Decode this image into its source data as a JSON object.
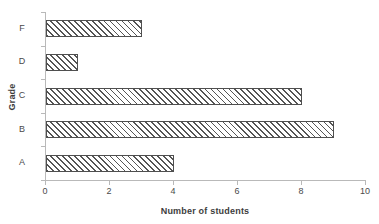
{
  "chart_data": {
    "type": "bar",
    "orientation": "horizontal",
    "title": "",
    "xlabel": "Number of students",
    "ylabel": "Grade",
    "categories": [
      "A",
      "B",
      "C",
      "D",
      "F"
    ],
    "values": [
      4,
      9,
      8,
      1,
      3
    ],
    "series": [
      {
        "name": "Number of students",
        "values": [
          4,
          9,
          8,
          1,
          3
        ]
      }
    ],
    "xlim": [
      0,
      10
    ],
    "xticks": [
      0,
      2,
      4,
      6,
      8,
      10
    ],
    "xtick_labels": [
      "0",
      "2",
      "4",
      "6",
      "8",
      "10"
    ],
    "ytick_labels": [
      "A",
      "B",
      "C",
      "D",
      "F"
    ],
    "grid": false,
    "legend": false,
    "legend_position": "none",
    "bar_fill": "hatch-diagonal",
    "bar_border_color": "#4f4f4f",
    "axis_color": "#b9b9b9",
    "text_color": "#4a4a4a"
  }
}
